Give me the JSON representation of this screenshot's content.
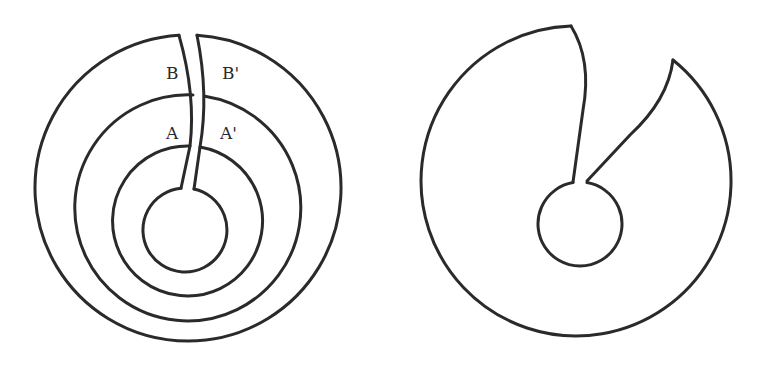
{
  "figures": [
    {
      "id": "left",
      "description": "Concentric annular regions cut along a slit from the outer boundary to the innermost hole",
      "labels": [
        {
          "id": "B",
          "text": "B"
        },
        {
          "id": "B-prime",
          "text": "B'"
        },
        {
          "id": "A",
          "text": "A"
        },
        {
          "id": "A-prime",
          "text": "A'"
        }
      ]
    },
    {
      "id": "right",
      "description": "The cut region deformed into a single simply connected shape with an inner hole"
    }
  ],
  "colors": {
    "stroke": "#2a2a2a",
    "background": "#ffffff"
  }
}
